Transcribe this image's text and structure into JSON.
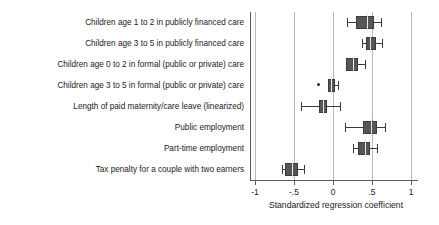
{
  "chart_data": {
    "type": "box",
    "title": "",
    "xlabel": "Standardized regression coefficient",
    "ylabel": "",
    "xlim": [
      -1,
      1
    ],
    "xticks": [
      -1,
      -0.5,
      0,
      0.5,
      1
    ],
    "xticklabels": [
      "-1",
      "-.5",
      "0",
      ".5",
      "1"
    ],
    "grid": "vertical",
    "legend": "none",
    "orientation": "horizontal",
    "categories": [
      "Children age 1 to 2 in publicly financed care",
      "Children age 3 to 5 in publicly financed care",
      "Children age 0 to 2 in formal (public or private) care",
      "Children age 3 to 5 in formal (public or private) care",
      "Length of paid maternity/care leave (linearized)",
      "Public employment",
      "Part-time employment",
      "Tax penalty for a couple with two earners"
    ],
    "boxes": [
      {
        "category": "Children age 1 to 2 in publicly financed care",
        "whisker_low": 0.18,
        "q1": 0.3,
        "median": 0.43,
        "q3": 0.53,
        "whisker_high": 0.62,
        "outliers": []
      },
      {
        "category": "Children age 3 to 5 in publicly financed care",
        "whisker_low": 0.37,
        "q1": 0.42,
        "median": 0.47,
        "q3": 0.55,
        "whisker_high": 0.63,
        "outliers": []
      },
      {
        "category": "Children age 0 to 2 in formal (public or private) care",
        "whisker_low": 0.17,
        "q1": 0.17,
        "median": 0.25,
        "q3": 0.32,
        "whisker_high": 0.41,
        "outliers": []
      },
      {
        "category": "Children age 3 to 5 in formal (public or private) care",
        "whisker_low": -0.06,
        "q1": -0.06,
        "median": -0.03,
        "q3": 0.02,
        "whisker_high": 0.07,
        "outliers": [
          -0.18
        ]
      },
      {
        "category": "Length of paid maternity/care leave (linearized)",
        "whisker_low": -0.41,
        "q1": -0.18,
        "median": -0.13,
        "q3": -0.08,
        "whisker_high": 0.09,
        "outliers": []
      },
      {
        "category": "Public employment",
        "whisker_low": 0.16,
        "q1": 0.39,
        "median": 0.49,
        "q3": 0.57,
        "whisker_high": 0.67,
        "outliers": []
      },
      {
        "category": "Part-time employment",
        "whisker_low": 0.26,
        "q1": 0.32,
        "median": 0.41,
        "q3": 0.47,
        "whisker_high": 0.56,
        "outliers": []
      },
      {
        "category": "Tax penalty for a couple with two earners",
        "whisker_low": -0.65,
        "q1": -0.61,
        "median": -0.53,
        "q3": -0.45,
        "whisker_high": -0.37,
        "outliers": []
      }
    ],
    "colors": {
      "box_fill": "#565656",
      "box_edge": "#3a3a3a",
      "median": "#e8e8e8",
      "gridline": "#b9b9b9",
      "axis": "#5a5a5a",
      "text": "#1a1a1a",
      "background": "#ffffff"
    }
  }
}
